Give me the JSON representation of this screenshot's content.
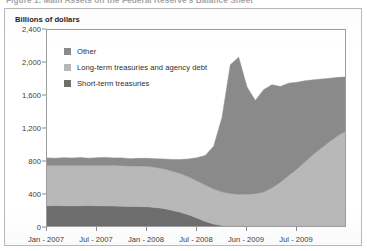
{
  "figure": {
    "caption": "Figure 1.  Main Assets on the Federal Reserve's Balance Sheet",
    "unit_label": "Billions of dollars"
  },
  "legend": {
    "position": "inside-top-left",
    "items": [
      {
        "label": "Other",
        "color": "#8a8a8a"
      },
      {
        "label": "Long-term treasuries and agency debt",
        "color": "#b8b8b8"
      },
      {
        "label": "Short-term treasuries",
        "color": "#6e6e6e"
      }
    ]
  },
  "chart_data": {
    "type": "area",
    "stacked": true,
    "title": "Main Assets on the Federal Reserve's Balance Sheet",
    "xlabel": "",
    "ylabel": "Billions of dollars",
    "ylim": [
      0,
      2400
    ],
    "yticks": [
      0,
      400,
      800,
      1200,
      1600,
      2000,
      2400
    ],
    "ytick_labels": [
      "0",
      "400",
      "800",
      "1,200",
      "1,600",
      "2,000",
      "2,400"
    ],
    "grid": false,
    "legend_position": "upper left",
    "xtick_labels": [
      "Jan - 2007",
      "Jul - 2007",
      "Jan - 2008",
      "Jul - 2008",
      "Jun - 2009",
      "Jul - 2009"
    ],
    "xtick_positions": [
      0,
      6,
      12,
      18,
      24,
      30
    ],
    "x": [
      0,
      1,
      2,
      3,
      4,
      5,
      6,
      7,
      8,
      9,
      10,
      11,
      12,
      13,
      14,
      15,
      16,
      17,
      18,
      19,
      20,
      21,
      22,
      23,
      24,
      25,
      26,
      27,
      28,
      29,
      30,
      31,
      32,
      33,
      34,
      35,
      36
    ],
    "series": [
      {
        "name": "Short-term treasuries",
        "color": "#6e6e6e",
        "values": [
          270,
          272,
          270,
          268,
          270,
          272,
          270,
          268,
          266,
          264,
          262,
          260,
          258,
          250,
          236,
          215,
          190,
          160,
          120,
          80,
          48,
          30,
          22,
          20,
          18,
          18,
          17,
          17,
          16,
          16,
          16,
          16,
          16,
          16,
          16,
          16,
          16
        ]
      },
      {
        "name": "Long-term treasuries and agency debt",
        "color": "#b8b8b8",
        "values": [
          490,
          488,
          490,
          492,
          490,
          488,
          490,
          492,
          494,
          492,
          490,
          492,
          490,
          486,
          482,
          476,
          470,
          462,
          452,
          440,
          424,
          408,
          396,
          390,
          392,
          398,
          420,
          470,
          540,
          620,
          700,
          790,
          880,
          960,
          1040,
          1110,
          1165
        ]
      },
      {
        "name": "Other",
        "color": "#8a8a8a",
        "values": [
          90,
          86,
          92,
          88,
          94,
          86,
          92,
          96,
          90,
          94,
          88,
          92,
          96,
          104,
          118,
          140,
          170,
          215,
          280,
          360,
          520,
          900,
          1560,
          1660,
          1300,
          1130,
          1240,
          1250,
          1160,
          1120,
          1050,
          980,
          900,
          830,
          760,
          700,
          650
        ]
      }
    ],
    "totals": [
      850,
      846,
      852,
      848,
      854,
      846,
      852,
      856,
      850,
      850,
      840,
      844,
      844,
      840,
      836,
      831,
      830,
      837,
      852,
      880,
      992,
      1338,
      1978,
      2070,
      1710,
      1546,
      1677,
      1737,
      1716,
      1756,
      1766,
      1786,
      1796,
      1806,
      1816,
      1826,
      1831
    ]
  }
}
